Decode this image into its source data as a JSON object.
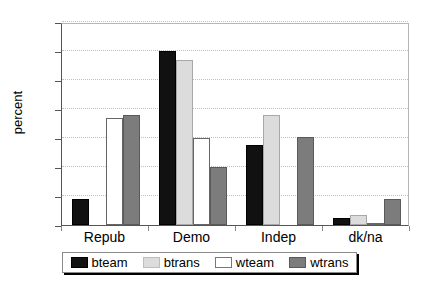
{
  "chart_data": {
    "type": "bar",
    "title": "",
    "xlabel": "",
    "ylabel": "percent",
    "ylim": [
      0,
      70
    ],
    "yticks": [
      0,
      10,
      20,
      30,
      40,
      50,
      60,
      70
    ],
    "grid": true,
    "legend_position": "bottom",
    "categories": [
      "Repub",
      "Demo",
      "Indep",
      "dk/na"
    ],
    "series": [
      {
        "name": "bteam",
        "color": "#111111",
        "values": [
          9,
          60,
          27.5,
          2.5
        ]
      },
      {
        "name": "btrans",
        "color": "#dcdcdc",
        "values": [
          0,
          57,
          38,
          3.5
        ]
      },
      {
        "name": "wteam",
        "color": "#ffffff",
        "values": [
          37,
          30,
          0,
          0.8
        ]
      },
      {
        "name": "wtrans",
        "color": "#7c7c7c",
        "values": [
          38,
          20,
          30.5,
          9
        ]
      }
    ]
  },
  "axes": {
    "y_title": "percent",
    "y_tick_labels": [
      "0",
      "10",
      "20",
      "30",
      "40",
      "50",
      "60",
      "70"
    ],
    "x_tick_labels": [
      "Repub",
      "Demo",
      "Indep",
      "dk/na"
    ]
  },
  "legend": {
    "items": [
      {
        "label": "bteam",
        "swatch": "black-swatch"
      },
      {
        "label": "btrans",
        "swatch": "light-gray-swatch"
      },
      {
        "label": "wteam",
        "swatch": "white-swatch"
      },
      {
        "label": "wtrans",
        "swatch": "medium-gray-swatch"
      }
    ]
  }
}
